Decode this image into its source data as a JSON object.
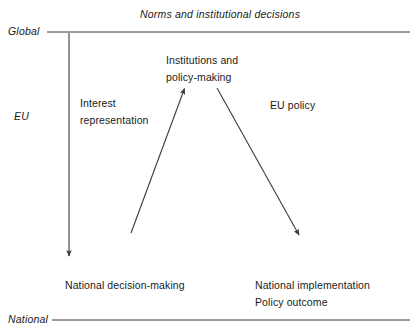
{
  "diagram": {
    "caption": "Norms and institutional decisions",
    "tiers": [
      {
        "name": "global",
        "label": "Global",
        "line_y": 32
      },
      {
        "name": "eu",
        "label": "EU"
      },
      {
        "name": "national",
        "label": "National",
        "line_y": 320
      }
    ],
    "nodes": [
      {
        "name": "interest-representation",
        "label": "Interest\nrepresentation"
      },
      {
        "name": "institutions-policy-making",
        "label": "Institutions and\npolicy-making"
      },
      {
        "name": "eu-policy",
        "label": "EU policy"
      },
      {
        "name": "national-decision-making",
        "label": "National decision-making"
      },
      {
        "name": "national-implementation",
        "label": "National implementation\nPolicy outcome"
      }
    ],
    "arrows": [
      {
        "name": "global-to-national-arrow",
        "x1": 69,
        "y1": 33,
        "x2": 69,
        "y2": 257
      },
      {
        "name": "interest-representation-arrow",
        "x1": 131,
        "y1": 233,
        "x2": 185,
        "y2": 87
      },
      {
        "name": "eu-policy-arrow",
        "x1": 217,
        "y1": 88,
        "x2": 300,
        "y2": 236
      }
    ],
    "colors": {
      "stroke": "#3a3a3a",
      "text": "#1a1a1a",
      "background": "#ffffff"
    }
  }
}
